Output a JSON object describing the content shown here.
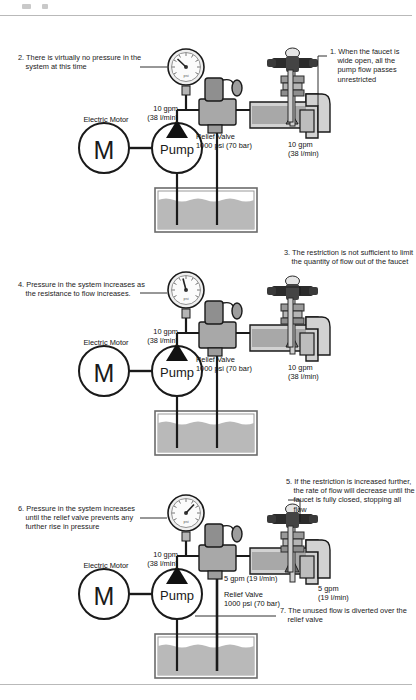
{
  "diagram": {
    "panels": [
      {
        "id": "panel-1",
        "callouts": [
          {
            "id": "callout-1",
            "text": "1. When the faucet is wide open, all the pump flow passes unrestricted"
          },
          {
            "id": "callout-2",
            "text": "2. There is virtually no pressure in the system at this time"
          }
        ],
        "labels": {
          "motor": "Electric Motor",
          "motor_symbol": "M",
          "pump": "Pump",
          "pump_flow": "10 gpm\n(38 l/min)",
          "pump_flow_line1": "10 gpm",
          "pump_flow_line2": "(38 l/min)",
          "relief_valve_line1": "Relief Valve",
          "relief_valve_line2": "1000 psi (70 bar)",
          "outlet_flow_line1": "10 gpm",
          "outlet_flow_line2": "(38 l/min)"
        },
        "state": {
          "faucet": "wide open",
          "gauge_reading": "low",
          "gauge_face_text": "psi"
        }
      },
      {
        "id": "panel-2",
        "callouts": [
          {
            "id": "callout-3",
            "text": "3. The restriction is not sufficient to limit the quantity of flow out of the faucet"
          },
          {
            "id": "callout-4",
            "text": "4. Pressure in the system increases as the resistance to flow increases."
          }
        ],
        "labels": {
          "motor": "Electric Motor",
          "motor_symbol": "M",
          "pump": "Pump",
          "pump_flow_line1": "10 gpm",
          "pump_flow_line2": "(38 l/min)",
          "relief_valve_line1": "Relief Valve",
          "relief_valve_line2": "1000 psi (70 bar)",
          "outlet_flow_line1": "10 gpm",
          "outlet_flow_line2": "(38 l/min)"
        },
        "state": {
          "faucet": "partially restricted",
          "gauge_reading": "medium",
          "gauge_face_text": "psi"
        }
      },
      {
        "id": "panel-3",
        "callouts": [
          {
            "id": "callout-5",
            "text": "5. If the restriction is increased further, the rate of flow will decrease until the faucet is fully closed, stopping all flow"
          },
          {
            "id": "callout-6",
            "text": "6. Pressure in the system increases until the relief valve prevents any further rise in pressure"
          },
          {
            "id": "callout-7",
            "text": "7. The unused flow is diverted over the relief valve"
          }
        ],
        "labels": {
          "motor": "Electric Motor",
          "motor_symbol": "M",
          "pump": "Pump",
          "pump_flow_line1": "10 gpm",
          "pump_flow_line2": "(38 l/min)",
          "relief_flow": "5 gpm (19 l/min)",
          "relief_valve_line1": "Relief Valve",
          "relief_valve_line2": "1000 psi (70 bar)",
          "outlet_flow_line1": "5 gpm",
          "outlet_flow_line2": "(19 l/min)"
        },
        "state": {
          "faucet": "heavily restricted",
          "gauge_reading": "high",
          "gauge_face_text": "psi"
        }
      }
    ],
    "colors": {
      "line": "#1a1a1a",
      "fluid": "#b3b3b3",
      "body_gray": "#a8a8a8",
      "body_dark": "#6f6f6f",
      "pipe_light": "#d2d2d2",
      "handle_dark": "#2b2b2b",
      "rule": "#b9b9b9",
      "background": "#ffffff"
    }
  }
}
